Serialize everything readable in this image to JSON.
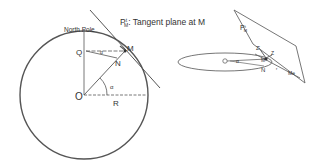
{
  "left_figure": {
    "title_prefix": "P",
    "title_sup": "t",
    "title_sub": "M",
    "title_suffix": ": Tangent plane at M",
    "north_pole": "North Pole",
    "point_M": "M",
    "point_N": "N",
    "point_Q": "Q",
    "point_O": "O",
    "radius": "R",
    "angle_alpha": "α",
    "angle_small": "α"
  },
  "right_figure": {
    "plane_label": "P",
    "plane_sup": "t",
    "plane_sub": "M",
    "point_Q": "Q",
    "point_N": "N",
    "point_M": "M",
    "axis_label": "Me",
    "z_prime": "Z'",
    "z": "Z",
    "alpha": "α",
    "r": "r"
  },
  "colors": {
    "stroke": "#555555",
    "text": "#333333"
  }
}
